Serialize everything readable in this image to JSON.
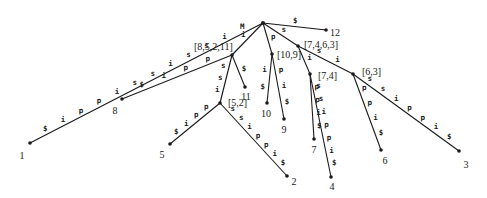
{
  "diagram": {
    "root": {
      "x": 263,
      "y": 23
    },
    "internal_nodes": [
      {
        "id": "n8521",
        "label": "[8,5,2,11]",
        "x": 232,
        "y": 55,
        "lx": 194,
        "ly": 46
      },
      {
        "id": "n52",
        "label": "[5,2]",
        "x": 220,
        "y": 103,
        "lx": 228,
        "ly": 102
      },
      {
        "id": "n109",
        "label": "[10,9]",
        "x": 272,
        "y": 54,
        "lx": 277,
        "ly": 54
      },
      {
        "id": "n7463",
        "label": "[7,4,6,3]",
        "x": 298,
        "y": 46,
        "lx": 304,
        "ly": 44
      },
      {
        "id": "n74",
        "label": "[7,4]",
        "x": 310,
        "y": 74,
        "lx": 318,
        "ly": 75
      },
      {
        "id": "n63",
        "label": "[6,3]",
        "x": 353,
        "y": 74,
        "lx": 362,
        "ly": 71
      }
    ],
    "leaves": [
      {
        "id": "l1",
        "label": "1",
        "x": 30,
        "y": 143,
        "lx": 22,
        "ly": 155
      },
      {
        "id": "l8",
        "label": "8",
        "x": 122,
        "y": 99,
        "lx": 115,
        "ly": 110
      },
      {
        "id": "l11",
        "label": "11",
        "x": 245,
        "y": 87,
        "lx": 246,
        "ly": 96
      },
      {
        "id": "l5",
        "label": "5",
        "x": 170,
        "y": 144,
        "lx": 162,
        "ly": 154
      },
      {
        "id": "l2",
        "label": "2",
        "x": 287,
        "y": 176,
        "lx": 294,
        "ly": 181
      },
      {
        "id": "l10",
        "label": "10",
        "x": 267,
        "y": 103,
        "lx": 266,
        "ly": 113
      },
      {
        "id": "l9",
        "label": "9",
        "x": 284,
        "y": 119,
        "lx": 284,
        "ly": 129
      },
      {
        "id": "l12",
        "label": "12",
        "x": 326,
        "y": 30,
        "lx": 335,
        "ly": 32
      },
      {
        "id": "l7",
        "label": "7",
        "x": 314,
        "y": 139,
        "lx": 314,
        "ly": 149
      },
      {
        "id": "l4",
        "label": "4",
        "x": 331,
        "y": 177,
        "lx": 332,
        "ly": 186
      },
      {
        "id": "l6",
        "label": "6",
        "x": 381,
        "y": 150,
        "lx": 385,
        "ly": 160
      },
      {
        "id": "l3",
        "label": "3",
        "x": 459,
        "y": 151,
        "lx": 466,
        "ly": 164
      }
    ],
    "edges": [
      {
        "from": "root",
        "to": "l1",
        "chars": [
          "M",
          "i",
          "s",
          "s",
          "i",
          "s",
          "s",
          "i",
          "p",
          "p",
          "i",
          "$"
        ]
      },
      {
        "from": "root",
        "to": "n8521",
        "chars": [
          "i"
        ]
      },
      {
        "from": "n8521",
        "to": "l8",
        "chars": [
          "p",
          "p",
          "i",
          "$"
        ]
      },
      {
        "from": "n8521",
        "to": "l11",
        "chars": [
          "$"
        ]
      },
      {
        "from": "n8521",
        "to": "n52",
        "chars": [
          "s",
          "s",
          "i"
        ]
      },
      {
        "from": "n52",
        "to": "l5",
        "chars": [
          "p",
          "p",
          "i",
          "$"
        ]
      },
      {
        "from": "n52",
        "to": "l2",
        "chars": [
          "s",
          "s",
          "i",
          "p",
          "p",
          "i",
          "$"
        ]
      },
      {
        "from": "root",
        "to": "n109",
        "chars": [
          "p"
        ]
      },
      {
        "from": "n109",
        "to": "l10",
        "chars": [
          "i",
          "$"
        ]
      },
      {
        "from": "n109",
        "to": "l9",
        "chars": [
          "p",
          "i",
          "$"
        ]
      },
      {
        "from": "root",
        "to": "l12",
        "chars": [
          "$"
        ]
      },
      {
        "from": "root",
        "to": "n7463",
        "chars": [
          "s"
        ]
      },
      {
        "from": "n7463",
        "to": "n74",
        "chars": [
          "i"
        ]
      },
      {
        "from": "n74",
        "to": "l7",
        "chars": [
          "p",
          "p",
          "i",
          "$"
        ]
      },
      {
        "from": "n74",
        "to": "l4",
        "chars": [
          "s",
          "s",
          "i",
          "p",
          "p",
          "i",
          "$"
        ]
      },
      {
        "from": "n7463",
        "to": "n63",
        "chars": [
          "s",
          "i"
        ]
      },
      {
        "from": "n63",
        "to": "l6",
        "chars": [
          "p",
          "p",
          "i",
          "$"
        ]
      },
      {
        "from": "n63",
        "to": "l3",
        "chars": [
          "s",
          "s",
          "i",
          "p",
          "p",
          "i",
          "$"
        ]
      }
    ]
  }
}
